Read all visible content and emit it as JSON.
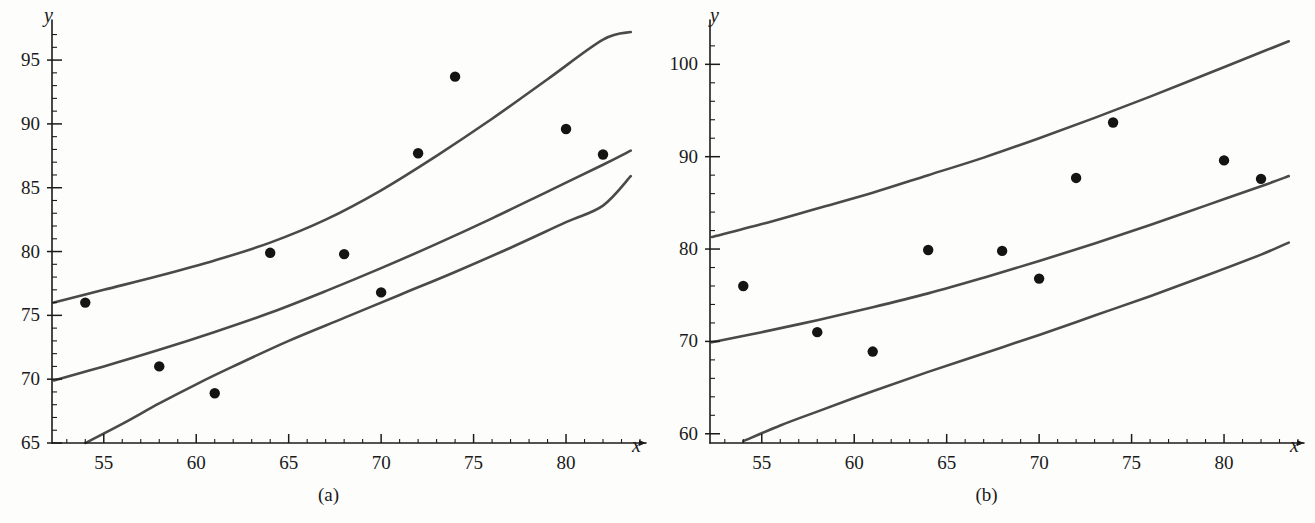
{
  "figure": {
    "background_color": "#fdfdfc",
    "line_color": "#4a4a4a",
    "point_color": "#141414",
    "axis_color": "#1b1b1b"
  },
  "panels": [
    {
      "id": "a",
      "caption": "(a)",
      "x_axis_name": "x",
      "y_axis_name": "y"
    },
    {
      "id": "b",
      "caption": "(b)",
      "x_axis_name": "x",
      "y_axis_name": "y"
    }
  ],
  "chart_data": [
    {
      "type": "scatter",
      "title": "(a)",
      "xlabel": "x",
      "ylabel": "y",
      "xlim": [
        52.2,
        84.0
      ],
      "ylim": [
        65,
        97.2
      ],
      "grid": false,
      "legend": "none",
      "x_ticks_major": [
        55,
        60,
        65,
        70,
        75,
        80
      ],
      "x_tick_labels": [
        "55",
        "60",
        "65",
        "70",
        "75",
        "80"
      ],
      "x_tick_minor_step": 1,
      "y_ticks_major": [
        65,
        70,
        75,
        80,
        85,
        90,
        95
      ],
      "y_tick_labels": [
        "65",
        "70",
        "75",
        "80",
        "85",
        "90",
        "95"
      ],
      "y_tick_minor_step": 1,
      "series": [
        {
          "name": "observations",
          "type": "scatter",
          "x": [
            54,
            58,
            61,
            64,
            68,
            70,
            72,
            74,
            80,
            82
          ],
          "y": [
            76.0,
            71.0,
            68.9,
            79.9,
            79.8,
            76.8,
            87.7,
            93.7,
            89.6,
            87.6
          ]
        },
        {
          "name": "upper confidence band",
          "type": "line",
          "x": [
            52.3,
            55,
            58,
            61,
            64,
            67,
            70,
            73,
            76,
            79,
            82,
            83.5
          ],
          "y": [
            76.0,
            77.0,
            78.1,
            79.3,
            80.7,
            82.5,
            84.8,
            87.5,
            90.4,
            93.5,
            96.6,
            97.2
          ]
        },
        {
          "name": "fitted regression line",
          "type": "line",
          "x": [
            52.3,
            55,
            58,
            61,
            64,
            67,
            70,
            73,
            76,
            79,
            82,
            83.5
          ],
          "y": [
            69.9,
            71.0,
            72.3,
            73.7,
            75.2,
            76.9,
            78.7,
            80.6,
            82.6,
            84.7,
            86.8,
            87.9
          ]
        },
        {
          "name": "lower confidence band",
          "type": "line",
          "x": [
            54.0,
            56,
            58,
            60,
            62,
            65,
            68,
            71,
            74,
            77,
            80,
            82,
            83.5
          ],
          "y": [
            65.0,
            66.5,
            68.1,
            69.6,
            71.0,
            73.0,
            74.8,
            76.6,
            78.4,
            80.3,
            82.3,
            83.6,
            85.9
          ]
        }
      ]
    },
    {
      "type": "scatter",
      "title": "(b)",
      "xlabel": "x",
      "ylabel": "y",
      "xlim": [
        52.2,
        84.0
      ],
      "ylim": [
        59.0,
        103.5
      ],
      "grid": false,
      "legend": "none",
      "x_ticks_major": [
        55,
        60,
        65,
        70,
        75,
        80
      ],
      "x_tick_labels": [
        "55",
        "60",
        "65",
        "70",
        "75",
        "80"
      ],
      "x_tick_minor_step": 1,
      "y_ticks_major": [
        60,
        70,
        80,
        90,
        100
      ],
      "y_tick_labels": [
        "60",
        "70",
        "80",
        "90",
        "100"
      ],
      "y_tick_minor_step": 2,
      "series": [
        {
          "name": "observations",
          "type": "scatter",
          "x": [
            54,
            58,
            61,
            64,
            68,
            70,
            72,
            74,
            80,
            82
          ],
          "y": [
            76.0,
            71.0,
            68.9,
            79.9,
            79.8,
            76.8,
            87.7,
            93.7,
            89.6,
            87.6
          ]
        },
        {
          "name": "upper prediction band",
          "type": "line",
          "x": [
            52.3,
            55,
            58,
            61,
            64,
            67,
            70,
            73,
            76,
            79,
            82,
            83.5
          ],
          "y": [
            81.3,
            82.7,
            84.4,
            86.1,
            88.0,
            89.9,
            92.0,
            94.2,
            96.5,
            98.9,
            101.3,
            102.5
          ]
        },
        {
          "name": "fitted regression line",
          "type": "line",
          "x": [
            52.3,
            55,
            58,
            61,
            64,
            67,
            70,
            73,
            76,
            79,
            82,
            83.5
          ],
          "y": [
            69.9,
            71.0,
            72.3,
            73.7,
            75.2,
            76.9,
            78.7,
            80.6,
            82.6,
            84.7,
            86.8,
            87.9
          ]
        },
        {
          "name": "lower prediction band",
          "type": "line",
          "x": [
            54.0,
            56,
            58,
            61,
            64,
            67,
            70,
            73,
            76,
            79,
            82,
            83.5
          ],
          "y": [
            59.2,
            60.9,
            62.4,
            64.6,
            66.7,
            68.7,
            70.7,
            72.8,
            74.9,
            77.1,
            79.4,
            80.7
          ]
        }
      ]
    }
  ]
}
